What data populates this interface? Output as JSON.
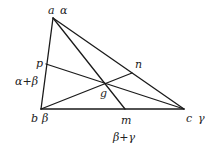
{
  "diagram": {
    "type": "triangle-cevians",
    "colors": {
      "line": "#1a1a1a",
      "text": "#222222",
      "background": "#ffffff"
    },
    "points": {
      "a": {
        "x": 53,
        "y": 18
      },
      "b": {
        "x": 41,
        "y": 109
      },
      "c": {
        "x": 184,
        "y": 109
      },
      "p": {
        "x": 46,
        "y": 64
      },
      "n": {
        "x": 132,
        "y": 73
      },
      "m": {
        "x": 125,
        "y": 109
      },
      "g": {
        "x": 104,
        "y": 83
      }
    },
    "segments": [
      [
        "a",
        "b"
      ],
      [
        "b",
        "c"
      ],
      [
        "a",
        "c"
      ],
      [
        "a",
        "m"
      ],
      [
        "b",
        "n"
      ],
      [
        "p",
        "c"
      ]
    ],
    "labels": {
      "a": "a",
      "a_weight": "α",
      "b": "b",
      "b_weight": "β",
      "c": "c",
      "c_weight": "γ",
      "p": "p",
      "p_weight": "α+β",
      "n": "n",
      "m": "m",
      "m_weight": "β+γ",
      "g": "g"
    }
  }
}
